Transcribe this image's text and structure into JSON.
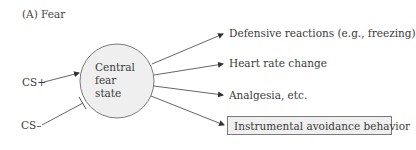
{
  "figure": {
    "title": "(A) Fear",
    "center_node": {
      "lines": [
        "Central",
        "fear",
        "state"
      ],
      "fill": "#efefef",
      "stroke": "#7a7a7a"
    },
    "inputs": [
      {
        "label": "CS+",
        "connector": "excitatory-arrow"
      },
      {
        "label": "CS–",
        "connector": "inhibitory-bar"
      }
    ],
    "outputs": [
      {
        "label": "Defensive reactions (e.g., freezing)",
        "boxed": false
      },
      {
        "label": "Heart rate change",
        "boxed": false
      },
      {
        "label": "Analgesia, etc.",
        "boxed": false
      },
      {
        "label": "Instrumental avoidance behavior",
        "boxed": true
      }
    ],
    "colors": {
      "line": "#555555",
      "text": "#3a3a3a",
      "box_fill": "#efefef",
      "box_stroke": "#7a7a7a"
    }
  }
}
